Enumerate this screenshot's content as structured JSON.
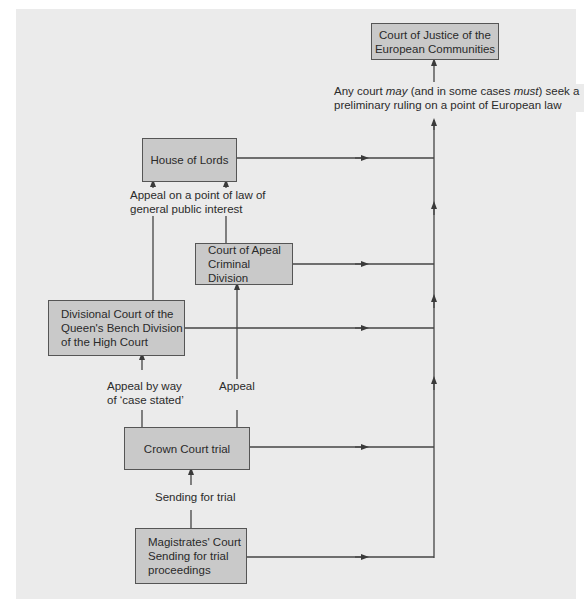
{
  "diagram": {
    "nodes": {
      "cjec": {
        "lines": [
          "Court of Justice of the",
          "European Communities"
        ]
      },
      "house_of_lords": {
        "lines": [
          "House of Lords"
        ]
      },
      "court_of_appeal": {
        "lines": [
          "Court of Apeal",
          "Criminal Division"
        ]
      },
      "divisional_court": {
        "lines": [
          "Divisional Court of the",
          "Queen's Bench Division",
          "of the High Court"
        ]
      },
      "crown_court": {
        "lines": [
          "Crown Court trial"
        ]
      },
      "magistrates_court": {
        "lines": [
          "Magistrates' Court",
          "Sending for trial",
          "proceedings"
        ]
      }
    },
    "edge_labels": {
      "preliminary_ruling": {
        "line1_pre": "Any court ",
        "line1_may": "may",
        "line1_mid": " (and in some cases ",
        "line1_must": "must",
        "line1_post": ") seek a",
        "line2": "preliminary ruling on a point of European law"
      },
      "appeal_point_of_law": [
        "Appeal on a point of law of",
        "general public interest"
      ],
      "appeal_case_stated": [
        "Appeal by way",
        "of ‘case stated’"
      ],
      "appeal": "Appeal",
      "sending_for_trial": "Sending for trial"
    },
    "edges": [
      {
        "from": "magistrates_court",
        "to": "crown_court",
        "label": "Sending for trial"
      },
      {
        "from": "crown_court",
        "to": "divisional_court",
        "label": "Appeal by way of 'case stated'"
      },
      {
        "from": "crown_court",
        "to": "court_of_appeal",
        "label": "Appeal"
      },
      {
        "from": "divisional_court",
        "to": "house_of_lords",
        "label": "Appeal on a point of law of general public interest"
      },
      {
        "from": "court_of_appeal",
        "to": "house_of_lords",
        "label": "Appeal on a point of law of general public interest"
      },
      {
        "from": "house_of_lords",
        "to": "cjec",
        "label": "preliminary ruling"
      },
      {
        "from": "court_of_appeal",
        "to": "cjec",
        "label": "preliminary ruling"
      },
      {
        "from": "divisional_court",
        "to": "cjec",
        "label": "preliminary ruling"
      },
      {
        "from": "crown_court",
        "to": "cjec",
        "label": "preliminary ruling"
      },
      {
        "from": "magistrates_court",
        "to": "cjec",
        "label": "preliminary ruling"
      }
    ],
    "colors": {
      "background": "#ebebeb",
      "box_fill": "#c9c9c9",
      "line": "#444444"
    }
  }
}
